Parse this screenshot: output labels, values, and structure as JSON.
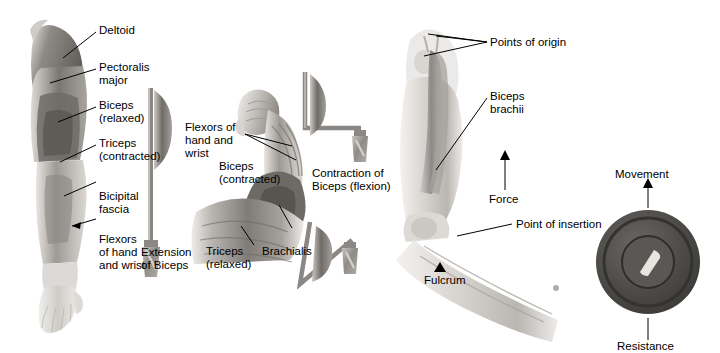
{
  "figure": {
    "background_color": "#ffffff",
    "style": "grayscale anatomical illustration",
    "panels": [
      {
        "name": "extension-panel",
        "caption": "Extension\nof Biceps",
        "labels": [
          "Deltoid",
          "Pectoralis\nmajor",
          "Biceps\n(relaxed)",
          "Triceps\n(contracted)",
          "Bicipital\nfascia",
          "Flexors\nof hand\nand wrist"
        ]
      },
      {
        "name": "contraction-panel",
        "caption": "Contraction of\nBiceps (flexion)",
        "labels": [
          "Flexors of\nhand and\nwrist",
          "Biceps\n(contracted)",
          "Triceps\n(relaxed)",
          "Brachialis"
        ]
      },
      {
        "name": "lever-panel",
        "labels": [
          "Points of origin",
          "Biceps\nbrachii",
          "Force",
          "Point of insertion",
          "Fulcrum",
          "Movement",
          "Resistance"
        ]
      }
    ]
  },
  "left_panel": {
    "deltoid": "Deltoid",
    "pectoralis_major": "Pectoralis\nmajor",
    "biceps_relaxed": "Biceps\n(relaxed)",
    "triceps_contracted": "Triceps\n(contracted)",
    "bicipital_fascia": "Bicipital\nfascia",
    "flexors": "Flexors\nof hand\nand wrist",
    "caption": "Extension\nof Biceps"
  },
  "middle_panel": {
    "flexors": "Flexors of\nhand and\nwrist",
    "biceps_contracted": "Biceps\n(contracted)",
    "triceps_relaxed": "Triceps\n(relaxed)",
    "brachialis": "Brachialis",
    "caption": "Contraction of\nBiceps (flexion)"
  },
  "right_panel": {
    "points_of_origin": "Points of origin",
    "biceps_brachii": "Biceps\nbrachii",
    "force": "Force",
    "point_of_insertion": "Point of insertion",
    "fulcrum": "Fulcrum",
    "movement": "Movement",
    "resistance": "Resistance"
  },
  "colors": {
    "text": "#000000",
    "leader_line": "#000000",
    "muscle_dark": "#5e5b58",
    "muscle_mid": "#8b8884",
    "skin_light": "#d8d4d0",
    "bone_pale": "#e2ded9",
    "weight_gray": "#9a9792",
    "dumbbell_dark": "#4a4846"
  }
}
